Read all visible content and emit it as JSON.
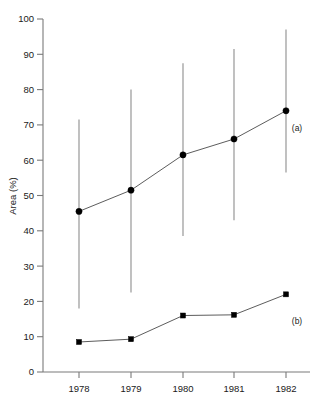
{
  "chart_data": {
    "type": "line",
    "title": "",
    "subtitle": "",
    "xlabel": "",
    "ylabel": "Area (%)",
    "categories": [
      "1978",
      "1979",
      "1980",
      "1981",
      "1982"
    ],
    "x": [
      1978,
      1979,
      1980,
      1981,
      1982
    ],
    "xlim": [
      1977.5,
      1982.6
    ],
    "ylim": [
      0,
      100
    ],
    "yticks": [
      0,
      10,
      20,
      30,
      40,
      50,
      60,
      70,
      80,
      90,
      100
    ],
    "ytick_labels": [
      "0",
      "10",
      "20",
      "30",
      "40",
      "50",
      "60",
      "70",
      "80",
      "90",
      "100"
    ],
    "xticks": [
      1978,
      1979,
      1980,
      1981,
      1982
    ],
    "xtick_labels": [
      "1978",
      "1979",
      "1980",
      "1981",
      "1982"
    ],
    "grid": false,
    "legend_position": "right-inline",
    "series": [
      {
        "name": "(a)",
        "marker": "circle",
        "values": [
          45.5,
          51.5,
          61.5,
          66.0,
          74.0
        ],
        "error_low": [
          18.0,
          22.5,
          38.5,
          43.0,
          56.5
        ],
        "error_high": [
          71.5,
          80.0,
          87.5,
          91.5,
          97.0
        ],
        "has_error_bars": true,
        "label_y_value": 69.0
      },
      {
        "name": "(b)",
        "marker": "square",
        "values": [
          8.5,
          9.3,
          16.0,
          16.2,
          22.0
        ],
        "has_error_bars": false,
        "label_y_value": 14.5
      }
    ]
  },
  "labels": {
    "series_a": "(a)",
    "series_b": "(b)",
    "y_axis_title": "Area (%)"
  },
  "colors": {
    "marker": "#000000",
    "line": "#4a4a4a",
    "errorbar": "#8d8d8d",
    "axis": "#7a7a7a",
    "text": "#1a1a1a",
    "background": "#ffffff"
  }
}
